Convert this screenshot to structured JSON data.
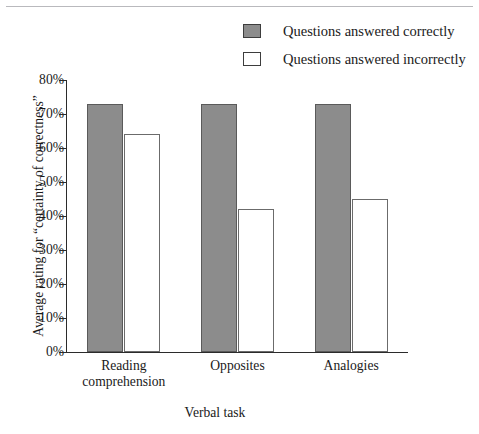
{
  "chart_data": {
    "type": "bar",
    "title": "",
    "subtitle": "",
    "xlabel": "Verbal task",
    "ylabel": "Average rating for “certainty of correctness”",
    "categories": [
      "Reading comprehension",
      "Opposites",
      "Analogies"
    ],
    "category_lines": [
      [
        "Reading",
        "comprehension"
      ],
      [
        "Opposites"
      ],
      [
        "Analogies"
      ]
    ],
    "series": [
      {
        "name": "Questions answered correctly",
        "color": "#8c8c8c",
        "values": [
          73,
          73,
          73
        ]
      },
      {
        "name": "Questions answered incorrectly",
        "color": "#ffffff",
        "values": [
          64,
          42,
          45
        ]
      }
    ],
    "ylim": [
      0,
      80
    ],
    "ytick_values": [
      0,
      10,
      20,
      30,
      40,
      50,
      60,
      70,
      80
    ],
    "ytick_labels": [
      "0%",
      "10%",
      "20%",
      "30%",
      "40%",
      "50%",
      "60%",
      "70%",
      "80%"
    ],
    "grid": false,
    "legend_position": "top-right"
  },
  "legend": {
    "items": [
      {
        "label": "Questions answered correctly",
        "swatch": "filled"
      },
      {
        "label": "Questions answered incorrectly",
        "swatch": "hollow"
      }
    ]
  },
  "colors": {
    "bar_fill": "#8c8c8c",
    "bar_fill_stroke": "#5a5a5a",
    "bar_hollow": "#ffffff",
    "bar_hollow_stroke": "#6b6b6b",
    "axis": "#2b2b2b",
    "rule": "#b9b9bd",
    "text": "#1a1a1a"
  }
}
